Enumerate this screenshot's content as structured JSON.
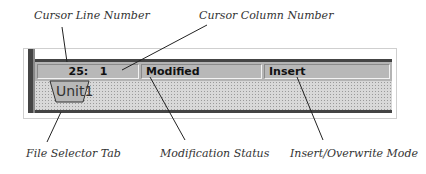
{
  "annotations": {
    "cursor_line": "Cursor Line Number",
    "cursor_column": "Cursor Column Number",
    "file_tab": "File Selector Tab",
    "modification": "Modification Status",
    "insert_mode": "Insert/Overwrite Mode"
  },
  "status_bar": {
    "position": "25:   1",
    "modified": "Modified",
    "mode": "Insert"
  },
  "tabs": [
    {
      "label": "Unit1",
      "active": true
    }
  ],
  "colors": {
    "statusbar_bg": "#b4b4b4",
    "frame_dark": "#444444",
    "tabstrip_bg": "#d8d8d8"
  }
}
